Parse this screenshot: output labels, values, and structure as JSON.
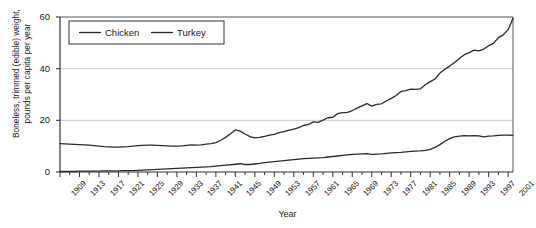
{
  "chart_data": {
    "type": "line",
    "title": "",
    "xlabel": "Year",
    "ylabel": "Boneless, trimmed (edible) weight,\npounds per capita per year",
    "ylim": [
      0,
      60
    ],
    "yticks": [
      0,
      20,
      40,
      60
    ],
    "xlim": [
      1909,
      2002
    ],
    "grid": "horizontal",
    "legend_position": "top-left-inside",
    "legend": [
      "Chicken",
      "Turkey"
    ],
    "xticks": [
      1909,
      1913,
      1917,
      1921,
      1925,
      1929,
      1933,
      1937,
      1941,
      1945,
      1949,
      1953,
      1957,
      1961,
      1965,
      1969,
      1973,
      1977,
      1981,
      1985,
      1989,
      1993,
      1997,
      2001
    ],
    "minor_tick_interval": 2,
    "line_color": "#2b2b2b",
    "grid_color": "#c9c9c9",
    "x": [
      1909,
      1910,
      1911,
      1912,
      1913,
      1914,
      1915,
      1916,
      1917,
      1918,
      1919,
      1920,
      1921,
      1922,
      1923,
      1924,
      1925,
      1926,
      1927,
      1928,
      1929,
      1930,
      1931,
      1932,
      1933,
      1934,
      1935,
      1936,
      1937,
      1938,
      1939,
      1940,
      1941,
      1942,
      1943,
      1944,
      1945,
      1946,
      1947,
      1948,
      1949,
      1950,
      1951,
      1952,
      1953,
      1954,
      1955,
      1956,
      1957,
      1958,
      1959,
      1960,
      1961,
      1962,
      1963,
      1964,
      1965,
      1966,
      1967,
      1968,
      1969,
      1970,
      1971,
      1972,
      1973,
      1974,
      1975,
      1976,
      1977,
      1978,
      1979,
      1980,
      1981,
      1982,
      1983,
      1984,
      1985,
      1986,
      1987,
      1988,
      1989,
      1990,
      1991,
      1992,
      1993,
      1994,
      1995,
      1996,
      1997,
      1998,
      1999,
      2000,
      2001,
      2002
    ],
    "series": [
      {
        "name": "Chicken",
        "values": [
          11.0,
          10.9,
          10.8,
          10.7,
          10.6,
          10.5,
          10.4,
          10.2,
          10.0,
          9.8,
          9.7,
          9.6,
          9.6,
          9.7,
          9.8,
          10.0,
          10.2,
          10.3,
          10.4,
          10.4,
          10.3,
          10.2,
          10.1,
          10.0,
          10.0,
          10.1,
          10.3,
          10.5,
          10.4,
          10.5,
          10.8,
          11.0,
          11.4,
          12.3,
          13.4,
          14.8,
          16.3,
          15.8,
          14.7,
          13.7,
          13.2,
          13.4,
          13.8,
          14.3,
          14.6,
          15.2,
          15.6,
          16.2,
          16.6,
          17.2,
          18.0,
          18.4,
          19.4,
          19.2,
          20.1,
          21.0,
          21.2,
          22.6,
          23.0,
          23.1,
          23.8,
          24.7,
          25.6,
          26.5,
          25.5,
          26.2,
          26.4,
          27.5,
          28.5,
          29.6,
          31.2,
          31.5,
          32.1,
          32.0,
          32.2,
          33.8,
          35.0,
          36.0,
          38.3,
          39.8,
          41.0,
          42.4,
          43.9,
          45.4,
          46.2,
          47.2,
          46.9,
          47.6,
          48.9,
          49.8,
          52.0,
          53.1,
          55.1,
          59.5
        ]
      },
      {
        "name": "Turkey",
        "values": [
          0.2,
          0.2,
          0.2,
          0.2,
          0.3,
          0.3,
          0.3,
          0.3,
          0.3,
          0.4,
          0.4,
          0.4,
          0.4,
          0.5,
          0.5,
          0.5,
          0.6,
          0.7,
          0.8,
          0.9,
          1.0,
          1.1,
          1.2,
          1.3,
          1.4,
          1.5,
          1.6,
          1.7,
          1.8,
          1.9,
          2.0,
          2.1,
          2.3,
          2.5,
          2.7,
          2.8,
          3.0,
          3.2,
          2.9,
          2.9,
          3.1,
          3.3,
          3.6,
          3.8,
          4.0,
          4.2,
          4.4,
          4.6,
          4.8,
          5.0,
          5.2,
          5.3,
          5.4,
          5.5,
          5.6,
          5.8,
          6.0,
          6.2,
          6.4,
          6.6,
          6.8,
          6.9,
          7.0,
          7.1,
          6.8,
          6.9,
          7.0,
          7.2,
          7.4,
          7.5,
          7.6,
          7.8,
          8.0,
          8.1,
          8.2,
          8.4,
          8.8,
          9.5,
          10.6,
          11.9,
          12.9,
          13.6,
          13.9,
          14.1,
          14.0,
          14.1,
          14.0,
          13.6,
          13.9,
          14.0,
          14.2,
          14.3,
          14.3,
          14.2
        ]
      }
    ]
  }
}
